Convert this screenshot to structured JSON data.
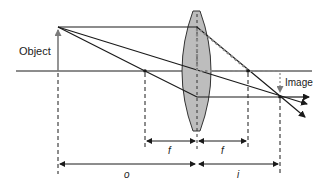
{
  "diagram": {
    "labels": {
      "object": "Object",
      "image": "Image",
      "focal_left": "f",
      "focal_right": "f",
      "object_distance": "o",
      "image_distance": "i"
    },
    "colors": {
      "line": "#1a1a1a",
      "lens_fill": "#bdbdbd",
      "lens_stroke": "#333333",
      "object_arrow": "#7a7a7a",
      "image_guide": "#888888"
    }
  }
}
